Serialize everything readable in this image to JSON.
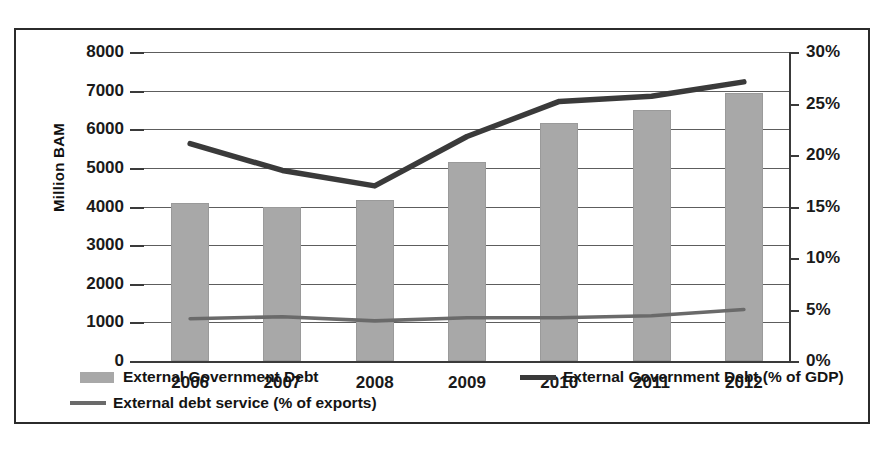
{
  "chart_data": {
    "type": "bar",
    "title": "",
    "categories": [
      "2006",
      "2007",
      "2008",
      "2009",
      "2010",
      "2011",
      "2012"
    ],
    "xlabel": "",
    "ylabel": "Million BAM",
    "ylabel_right": "",
    "ylim": [
      0,
      8000
    ],
    "ylim_right": [
      0,
      30
    ],
    "ytick_labels": [
      "8000",
      "7000",
      "6000",
      "5000",
      "4000",
      "3000",
      "2000",
      "1000",
      "0"
    ],
    "ytick_values": [
      8000,
      7000,
      6000,
      5000,
      4000,
      3000,
      2000,
      1000,
      0
    ],
    "ytick_labels_right": [
      "30%",
      "25%",
      "20%",
      "15%",
      "10%",
      "5%",
      "0%"
    ],
    "ytick_values_right": [
      30,
      25,
      20,
      15,
      10,
      5,
      0
    ],
    "grid": true,
    "legend_position": "bottom",
    "series": [
      {
        "name": "External Government Debt",
        "kind": "bar",
        "axis": "left",
        "unit": "Million BAM",
        "color": "#a8a8a8",
        "values": [
          4080,
          4000,
          4180,
          5150,
          6170,
          6500,
          6950
        ]
      },
      {
        "name": "External Government Debt (% of GDP)",
        "kind": "line",
        "axis": "right",
        "unit": "%",
        "color": "#3a3a3a",
        "values": [
          21.1,
          18.5,
          17.0,
          21.8,
          25.2,
          25.7,
          27.1
        ]
      },
      {
        "name": "External debt service (% of exports)",
        "kind": "line",
        "axis": "right",
        "unit": "%",
        "color": "#6a6a6a",
        "values": [
          4.1,
          4.3,
          3.9,
          4.2,
          4.2,
          4.4,
          5.0
        ]
      }
    ]
  },
  "axis": {
    "y_title": "Million BAM"
  },
  "legend": {
    "gov_debt": "External Government Debt",
    "gov_debt_gdp": "External Government Debt (% of GDP)",
    "debt_service": "External debt service (% of exports)"
  }
}
